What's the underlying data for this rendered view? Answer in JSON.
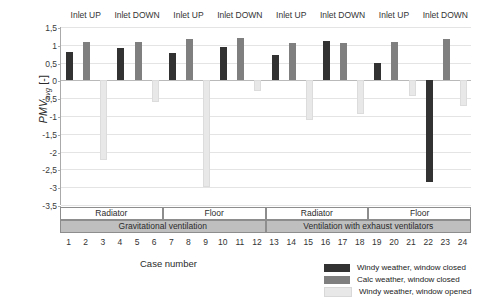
{
  "chart_data": {
    "type": "bar",
    "title": "",
    "xlabel": "Case number",
    "ylabel": "PMVavg [-]",
    "ylim": [
      -3.5,
      1.5
    ],
    "grid": true,
    "legend_position": "bottom-right",
    "categories": [
      "1",
      "2",
      "3",
      "4",
      "5",
      "6",
      "7",
      "8",
      "9",
      "10",
      "11",
      "12",
      "13",
      "14",
      "15",
      "16",
      "17",
      "18",
      "19",
      "20",
      "21",
      "22",
      "23",
      "24"
    ],
    "ytick_labels": [
      "1,5",
      "1",
      "0,5",
      "0",
      "-0,5",
      "-1",
      "-1,5",
      "-2",
      "-2,5",
      "-3",
      "-3,5"
    ],
    "ytick_values": [
      1.5,
      1.0,
      0.5,
      0.0,
      -0.5,
      -1.0,
      -1.5,
      -2.0,
      -2.5,
      -3.0,
      -3.5
    ],
    "series": [
      {
        "name": "Windy weather, window closed",
        "color": "#323232"
      },
      {
        "name": "Calc weather, window closed",
        "color": "#7f7f7f"
      },
      {
        "name": "Windy weather, window opened",
        "color": "#e8e8e8"
      }
    ],
    "bars": [
      {
        "case": "1",
        "series": "Windy weather, window closed",
        "value": 0.8
      },
      {
        "case": "2",
        "series": "Calc weather, window closed",
        "value": 1.08
      },
      {
        "case": "3",
        "series": "Windy weather, window opened",
        "value": -2.25
      },
      {
        "case": "4",
        "series": "Windy weather, window closed",
        "value": 0.92
      },
      {
        "case": "5",
        "series": "Calc weather, window closed",
        "value": 1.07
      },
      {
        "case": "6",
        "series": "Windy weather, window opened",
        "value": -0.62
      },
      {
        "case": "7",
        "series": "Windy weather, window closed",
        "value": 0.78
      },
      {
        "case": "8",
        "series": "Calc weather, window closed",
        "value": 1.15
      },
      {
        "case": "9",
        "series": "Windy weather, window opened",
        "value": -3.0
      },
      {
        "case": "10",
        "series": "Windy weather, window closed",
        "value": 0.94
      },
      {
        "case": "11",
        "series": "Calc weather, window closed",
        "value": 1.19
      },
      {
        "case": "12",
        "series": "Windy weather, window opened",
        "value": -0.3
      },
      {
        "case": "13",
        "series": "Windy weather, window closed",
        "value": 0.7
      },
      {
        "case": "14",
        "series": "Calc weather, window closed",
        "value": 1.05
      },
      {
        "case": "15",
        "series": "Windy weather, window opened",
        "value": -1.12
      },
      {
        "case": "16",
        "series": "Windy weather, window closed",
        "value": 1.1
      },
      {
        "case": "17",
        "series": "Calc weather, window closed",
        "value": 1.05
      },
      {
        "case": "18",
        "series": "Windy weather, window opened",
        "value": -0.95
      },
      {
        "case": "19",
        "series": "Windy weather, window closed",
        "value": 0.5
      },
      {
        "case": "20",
        "series": "Calc weather, window closed",
        "value": 1.08
      },
      {
        "case": "21",
        "series": "Windy weather, window opened",
        "value": -0.45
      },
      {
        "case": "22",
        "series": "Windy weather, window closed",
        "value": -2.85
      },
      {
        "case": "23",
        "series": "Calc weather, window closed",
        "value": 1.15
      },
      {
        "case": "24",
        "series": "Windy weather, window opened",
        "value": -0.72
      }
    ],
    "inlet_groups": [
      {
        "label": "Inlet UP",
        "start": 1,
        "span": 3
      },
      {
        "label": "Inlet DOWN",
        "start": 4,
        "span": 3
      },
      {
        "label": "Inlet UP",
        "start": 7,
        "span": 3
      },
      {
        "label": "Inlet DOWN",
        "start": 10,
        "span": 3
      },
      {
        "label": "Inlet UP",
        "start": 13,
        "span": 3
      },
      {
        "label": "Inlet DOWN",
        "start": 16,
        "span": 3
      },
      {
        "label": "Inlet UP",
        "start": 19,
        "span": 3
      },
      {
        "label": "Inlet DOWN",
        "start": 22,
        "span": 3
      }
    ],
    "heat_groups": [
      {
        "label": "Radiator",
        "start": 1,
        "span": 6
      },
      {
        "label": "Floor",
        "start": 7,
        "span": 6
      },
      {
        "label": "Radiator",
        "start": 13,
        "span": 6
      },
      {
        "label": "Floor",
        "start": 19,
        "span": 6
      }
    ],
    "ventilation_groups": [
      {
        "label": "Gravitational ventilation",
        "start": 1,
        "span": 12
      },
      {
        "label": "Ventilation with exhaust ventilators",
        "start": 13,
        "span": 12
      }
    ]
  },
  "axis": {
    "ylabel_main": "PMV",
    "ylabel_sub": "avg",
    "ylabel_unit": "[-]",
    "xlabel": "Case number"
  },
  "legend": {
    "items": [
      {
        "label": "Windy weather, window closed",
        "color": "#323232"
      },
      {
        "label": "Calc weather, window closed",
        "color": "#7f7f7f"
      },
      {
        "label": "Windy weather, window opened",
        "color": "#e8e8e8"
      }
    ]
  },
  "caption": {
    "text": ""
  }
}
